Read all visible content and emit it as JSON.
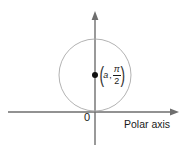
{
  "figure": {
    "background_color": "#ffffff",
    "width": 186,
    "height": 152
  },
  "axes": {
    "horizontal": {
      "name": "polar-axis",
      "label": "Polar axis",
      "color": "#6e6e6e",
      "x_start": 8,
      "x_end": 178,
      "y": 112,
      "arrow": "right"
    },
    "vertical": {
      "name": "theta-pi-over-2-axis",
      "label": "",
      "color": "#6e6e6e",
      "x": 95,
      "y_start": 145,
      "y_end": 11,
      "arrow": "up"
    },
    "origin": {
      "label": "0",
      "x": 95,
      "y": 112
    }
  },
  "circle": {
    "name": "polar-circle",
    "center_x": 95,
    "center_y": 75,
    "radius": 36,
    "stroke_color": "#a9a9a9",
    "stroke_width": 0.9,
    "fill": "none"
  },
  "center_point": {
    "name": "circle-center-point",
    "x": 95,
    "y": 75,
    "radius": 3,
    "color": "#111111",
    "label": {
      "open_paren": "(",
      "r_value": "a",
      "comma": ",",
      "angle_numerator": "π",
      "angle_denominator": "2",
      "close_paren": ")",
      "plain_text": "(a, π/2)"
    }
  }
}
